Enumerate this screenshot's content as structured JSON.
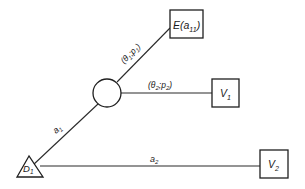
{
  "diagram": {
    "type": "decision-tree",
    "nodes": {
      "decision": {
        "label": "D",
        "subscript": "1",
        "shape": "triangle"
      },
      "chance": {
        "label": "",
        "shape": "circle"
      },
      "outcome_e": {
        "label": "E(a",
        "subscript": "11",
        "suffix": ")",
        "shape": "square"
      },
      "outcome_v1": {
        "label": "V",
        "subscript": "1",
        "shape": "square"
      },
      "outcome_v2": {
        "label": "V",
        "subscript": "2",
        "shape": "square"
      }
    },
    "edges": {
      "a1": {
        "label": "a",
        "subscript": "1",
        "from": "decision",
        "to": "chance"
      },
      "a2": {
        "label": "a",
        "subscript": "2",
        "from": "decision",
        "to": "outcome_v2"
      },
      "theta1": {
        "open": "(θ",
        "sub1": "1",
        "sep": ";p",
        "sub2": "1",
        "close": ")",
        "from": "chance",
        "to": "outcome_e"
      },
      "theta2": {
        "open": "(θ",
        "sub1": "2",
        "sep": ";p",
        "sub2": "2",
        "close": ")",
        "from": "chance",
        "to": "outcome_v1"
      }
    },
    "colors": {
      "line": "#2a2a2a",
      "background": "#ffffff"
    }
  }
}
